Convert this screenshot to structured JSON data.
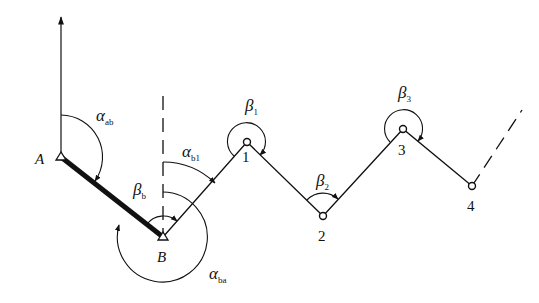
{
  "diagram": {
    "type": "traverse-azimuth-diagram",
    "colors": {
      "stroke": "#111111",
      "background": "#ffffff"
    },
    "north_arrow": {
      "x": 61,
      "y_top": 15,
      "y_bottom": 157
    },
    "control_points": [
      {
        "id": "A",
        "label": "A",
        "x": 61,
        "y": 157,
        "marker": "triangle"
      },
      {
        "id": "B",
        "label": "B",
        "x": 163,
        "y": 237,
        "marker": "triangle"
      }
    ],
    "traverse_points": [
      {
        "id": "1",
        "label": "1",
        "x": 247,
        "y": 142,
        "marker": "circle"
      },
      {
        "id": "2",
        "label": "2",
        "x": 323,
        "y": 216,
        "marker": "circle"
      },
      {
        "id": "3",
        "label": "3",
        "x": 403,
        "y": 129,
        "marker": "circle"
      },
      {
        "id": "4",
        "label": "4",
        "x": 472,
        "y": 186,
        "marker": "circle"
      }
    ],
    "angles": {
      "alpha_ab": {
        "symbol": "α",
        "sub": "ab"
      },
      "alpha_b1": {
        "symbol": "α",
        "sub": "b1"
      },
      "alpha_ba": {
        "symbol": "α",
        "sub": "ba"
      },
      "beta_b": {
        "symbol": "β",
        "sub": "b"
      },
      "beta_1": {
        "symbol": "β",
        "sub": "1"
      },
      "beta_2": {
        "symbol": "β",
        "sub": "2"
      },
      "beta_3": {
        "symbol": "β",
        "sub": "3"
      }
    }
  }
}
